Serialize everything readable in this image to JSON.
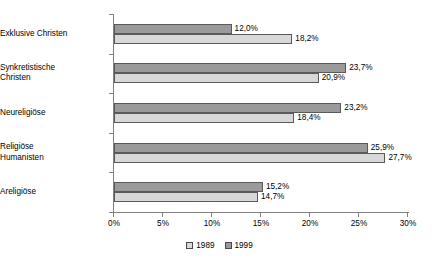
{
  "chart_data": {
    "type": "bar",
    "orientation": "horizontal",
    "title": "",
    "xlabel": "",
    "ylabel": "",
    "categories": [
      "Exklusive Christen",
      "Synkretistische\nChristen",
      "Neureligiöse",
      "Religiöse\nHumanisten",
      "Areligiöse"
    ],
    "series": [
      {
        "name": "1989",
        "color": "#d8d8d8",
        "values": [
          18.2,
          20.9,
          18.4,
          27.7,
          14.7
        ],
        "labels": [
          "18,2%",
          "20,9%",
          "18,4%",
          "27,7%",
          "14,7%"
        ]
      },
      {
        "name": "1999",
        "color": "#9a9a9a",
        "values": [
          12.0,
          23.7,
          23.2,
          25.9,
          15.2
        ],
        "labels": [
          "12,0%",
          "23,7%",
          "23,2%",
          "25,9%",
          "15,2%"
        ]
      }
    ],
    "xlim": [
      0,
      30
    ],
    "xticks": [
      0,
      5,
      10,
      15,
      20,
      25,
      30
    ],
    "xtick_labels": [
      "0%",
      "5%",
      "10%",
      "15%",
      "20%",
      "25%",
      "30%"
    ],
    "grid": false,
    "legend_position": "bottom",
    "legend": [
      "1989",
      "1999"
    ]
  }
}
